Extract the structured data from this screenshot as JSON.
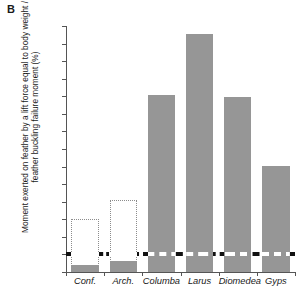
{
  "panel": {
    "letter": "B"
  },
  "chart_data": {
    "type": "bar",
    "title": "",
    "xlabel": "",
    "ylabel": "Moment exerted on feather by a lift force equal to body weight / feather buckling failure moment (%)",
    "ylim": [
      0,
      1400
    ],
    "ytick_step": 100,
    "grid": false,
    "legend": "none",
    "categories": [
      "Conf.",
      "Arch.",
      "Columba",
      "Larus",
      "Diomedea",
      "Gyps"
    ],
    "values": [
      40,
      65,
      1010,
      1355,
      995,
      605
    ],
    "series": [
      {
        "name": "Moment ratio (%)",
        "values": [
          40,
          65,
          1010,
          1355,
          995,
          605
        ]
      },
      {
        "name": "Upper estimate (dotted outline)",
        "values": [
          300,
          410,
          null,
          null,
          null,
          null
        ]
      }
    ],
    "ytick_labels": [
      "0",
      "100",
      "200",
      "300",
      "400",
      "500",
      "600",
      "700",
      "800",
      "900",
      "1000",
      "1100",
      "1200",
      "1300",
      "1400"
    ],
    "reference_line": {
      "value": 100,
      "label": "100",
      "style": "dashed"
    },
    "colors": {
      "bar": "#969696",
      "outline": "#8c8c8c",
      "reference_line": "#111111",
      "axis": "#555555",
      "text": "#1a1a1a"
    }
  }
}
